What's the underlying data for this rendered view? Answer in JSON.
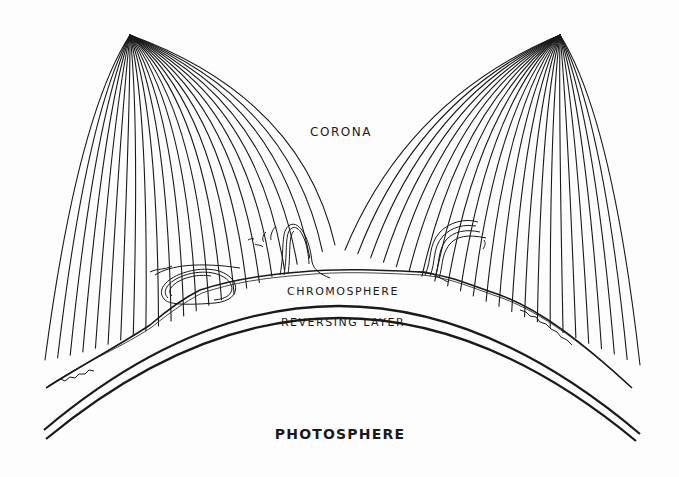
{
  "diagram": {
    "labels": {
      "corona": "CORONA",
      "chromosphere": "CHROMOSPHERE",
      "reversing_layer": "REVERSING LAYER",
      "photosphere": "PHOTOSPHERE"
    },
    "elements": [
      {
        "name": "left-coronal-streamer",
        "description": "fan of curved ray lines converging at apex near top-left"
      },
      {
        "name": "right-coronal-streamer",
        "description": "fan of curved ray lines converging at apex near top-right"
      },
      {
        "name": "left-prominence",
        "description": "looping solar prominence rising from chromosphere"
      },
      {
        "name": "right-prominence",
        "description": "curling solar prominence rising from chromosphere"
      },
      {
        "name": "chromosphere-boundary",
        "description": "wavy irregular line along solar limb"
      },
      {
        "name": "reversing-layer-arcs",
        "description": "two parallel concentric arcs"
      }
    ],
    "colors": {
      "ink": "#1a1a1a",
      "paper": "#fdfdfd"
    }
  }
}
